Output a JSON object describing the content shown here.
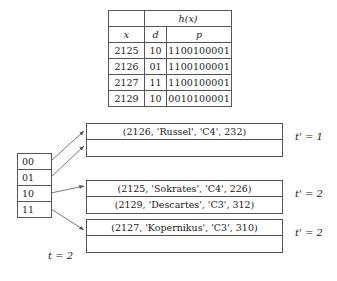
{
  "hash_table": {
    "group_header": "h(x)",
    "columns": [
      "x",
      "d",
      "p"
    ],
    "rows": [
      {
        "x": "2125",
        "d": "10",
        "p": "1100100001"
      },
      {
        "x": "2126",
        "d": "01",
        "p": "1100100001"
      },
      {
        "x": "2127",
        "d": "11",
        "p": "1100100001"
      },
      {
        "x": "2129",
        "d": "10",
        "p": "0010100001"
      }
    ]
  },
  "directory": {
    "slots": [
      "00",
      "01",
      "10",
      "11"
    ],
    "depth_label": "t = 2"
  },
  "buckets": [
    {
      "local_depth_label": "t' = 1",
      "records": [
        "(2126, 'Russel', 'C4', 232)",
        ""
      ]
    },
    {
      "local_depth_label": "t' = 2",
      "records": [
        "(2125, 'Sokrates', 'C4', 226)",
        "(2129, 'Descartes', 'C3', 312)"
      ]
    },
    {
      "local_depth_label": "t' = 2",
      "records": [
        "(2127, 'Kopernikus', 'C3', 310)",
        ""
      ]
    }
  ],
  "colors": {
    "line": "#555555",
    "text": "#1a1a1a",
    "background": "#ffffff"
  }
}
